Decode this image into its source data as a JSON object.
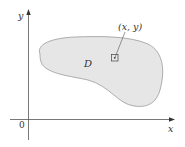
{
  "diagram": {
    "region_label": "D",
    "point_label": "(x, y)",
    "x_axis_label": "x",
    "y_axis_label": "y",
    "origin_label": "0",
    "colors": {
      "region_fill": "#e6e6e6",
      "region_stroke": "#9a9a9a",
      "axis": "#555555",
      "text": "#333333"
    }
  }
}
